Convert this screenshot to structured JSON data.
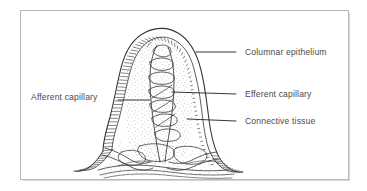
{
  "figure": {
    "frame": {
      "border_color": "#b9b9b9",
      "background": "#ffffff"
    },
    "ink_color": "#333333",
    "text_color": "#4a4a4a"
  },
  "labels": [
    {
      "id": "columnar-epithelium",
      "text": "Columnar epithelium",
      "side": "right",
      "leader_from_x": 236,
      "leader_from_y": 52,
      "leader_to_x": 196,
      "leader_to_y": 52
    },
    {
      "id": "efferent-capillary",
      "text": "Efferent capillary",
      "side": "right",
      "leader_from_x": 236,
      "leader_from_y": 94,
      "leader_to_x": 172,
      "leader_to_y": 92
    },
    {
      "id": "connective-tissue",
      "text": "Connective tissue",
      "side": "right",
      "leader_from_x": 236,
      "leader_from_y": 121,
      "leader_to_x": 187,
      "leader_to_y": 119
    },
    {
      "id": "afferent-capillary",
      "text": "Afferent capillary",
      "side": "left",
      "leader_from_x": 118,
      "leader_from_y": 100,
      "leader_to_x": 150,
      "leader_to_y": 100
    }
  ],
  "diagram": {
    "type": "biological-line-drawing",
    "parts": [
      {
        "name": "columnar-epithelium",
        "description": "hatched brush-border layer outlining the villus"
      },
      {
        "name": "efferent-capillary",
        "description": "central vessel network inside the villus core"
      },
      {
        "name": "connective-tissue",
        "description": "stippled lamina propria core"
      },
      {
        "name": "afferent-capillary",
        "description": "vessel entering at the lower left of the villus"
      }
    ]
  }
}
